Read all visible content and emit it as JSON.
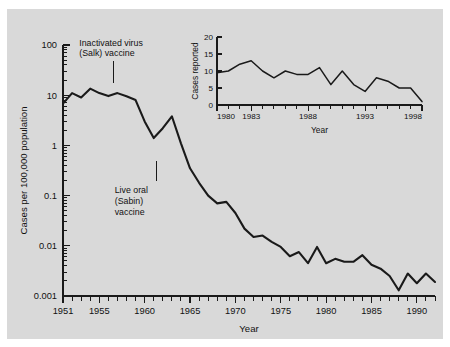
{
  "figure": {
    "background_color": "#d9d9d9",
    "page_color": "#ffffff",
    "line_color": "#1a1a1a"
  },
  "annotations": {
    "salk": {
      "line1": "Inactivated virus",
      "line2": "(Salk) vaccine",
      "year": 1955
    },
    "sabin": {
      "line1": "Live oral",
      "line2": "(Sabin)",
      "line3": "vaccine",
      "year": 1961
    }
  },
  "chart_data": [
    {
      "id": "main",
      "type": "line",
      "title": "",
      "xlabel": "Year",
      "ylabel": "Cases per 100,000 population",
      "yscale": "log",
      "ylim": [
        0.001,
        100
      ],
      "xlim": [
        1951,
        1992
      ],
      "ytick_labels": [
        "100",
        "10",
        "1",
        "0.1",
        "0.01",
        "0.001"
      ],
      "ytick_values": [
        100,
        10,
        1,
        0.1,
        0.01,
        0.001
      ],
      "xtick_labels": [
        "1951",
        "1955",
        "1960",
        "1965",
        "1970",
        "1975",
        "1980",
        "1985",
        "1990"
      ],
      "xtick_values": [
        1951,
        1955,
        1960,
        1965,
        1970,
        1975,
        1980,
        1985,
        1990
      ],
      "grid": false,
      "legend": "none",
      "x": [
        1951,
        1952,
        1953,
        1954,
        1955,
        1956,
        1957,
        1958,
        1959,
        1960,
        1961,
        1962,
        1963,
        1964,
        1965,
        1966,
        1967,
        1968,
        1969,
        1970,
        1971,
        1972,
        1973,
        1974,
        1975,
        1976,
        1977,
        1978,
        1979,
        1980,
        1981,
        1982,
        1983,
        1984,
        1985,
        1986,
        1987,
        1988,
        1989,
        1990,
        1991,
        1992
      ],
      "values": [
        6.8,
        11.0,
        9.0,
        13.5,
        11.0,
        9.6,
        11.0,
        9.5,
        8.0,
        3.0,
        1.4,
        2.2,
        3.8,
        1.1,
        0.35,
        0.18,
        0.1,
        0.07,
        0.075,
        0.045,
        0.022,
        0.015,
        0.016,
        0.012,
        0.0095,
        0.0062,
        0.0075,
        0.0045,
        0.0095,
        0.0045,
        0.0055,
        0.0048,
        0.0048,
        0.0065,
        0.0042,
        0.0035,
        0.0025,
        0.0013,
        0.0028,
        0.0018,
        0.0028,
        0.0019
      ]
    },
    {
      "id": "inset",
      "type": "line",
      "title": "",
      "xlabel": "Year",
      "ylabel": "Cases reported",
      "yscale": "linear",
      "ylim": [
        0,
        20
      ],
      "xlim": [
        1980,
        1998
      ],
      "ytick_labels": [
        "20",
        "15",
        "10",
        "5",
        "0"
      ],
      "ytick_values": [
        20,
        15,
        10,
        5,
        0
      ],
      "xtick_labels": [
        "1980",
        "1983",
        "1988",
        "1993",
        "1998"
      ],
      "xtick_values": [
        1980,
        1983,
        1988,
        1993,
        1998
      ],
      "grid": false,
      "legend": "none",
      "x": [
        1980,
        1981,
        1982,
        1983,
        1984,
        1985,
        1986,
        1987,
        1988,
        1989,
        1990,
        1991,
        1992,
        1993,
        1994,
        1995,
        1996,
        1997,
        1998
      ],
      "values": [
        9.5,
        10,
        12,
        13,
        10,
        8,
        10,
        9,
        9,
        11,
        6,
        10,
        6,
        4,
        8,
        7,
        5,
        5,
        1
      ]
    }
  ]
}
